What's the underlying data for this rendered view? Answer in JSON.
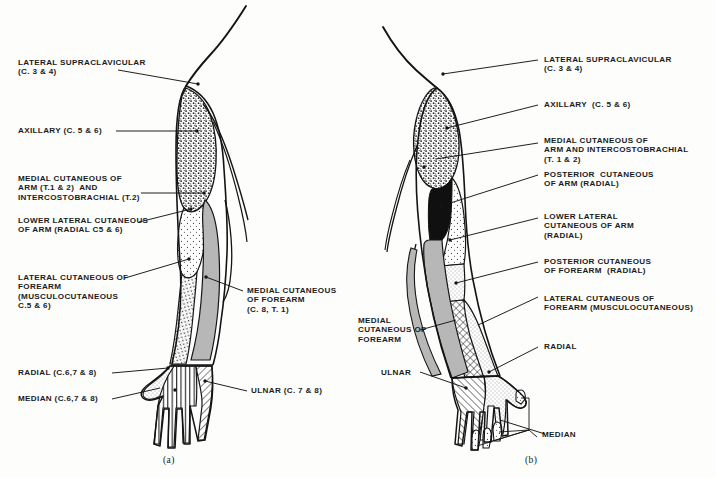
{
  "figure": {
    "panels": [
      {
        "id": "a",
        "caption": "(a)",
        "view": "anterior",
        "labels_left": [
          {
            "name": "lateral-supraclavicular",
            "lines": [
              "LATERAL SUPRACLAVICULAR",
              "(C. 3 & 4)"
            ]
          },
          {
            "name": "axillary",
            "lines": [
              "AXILLARY (C. 5 & 6)"
            ]
          },
          {
            "name": "medial-cutaneous-of-arm-intercostobrachial",
            "lines": [
              "MEDIAL CUTANEOUS OF",
              "ARM (T.1 & 2)  AND",
              "INTERCOSTOBRACHIAL (T.2)"
            ]
          },
          {
            "name": "lower-lateral-cutaneous-of-arm",
            "lines": [
              "LOWER LATERAL CUTANEOUS",
              "OF ARM (RADIAL C5 & 6)"
            ]
          },
          {
            "name": "lateral-cutaneous-of-forearm",
            "lines": [
              "LATERAL CUTANEOUS OF",
              "FOREARM",
              "(MUSCULOCUTANEOUS",
              "C.5 & 6)"
            ]
          },
          {
            "name": "radial",
            "lines": [
              "RADIAL (C.6,7 & 8)"
            ]
          },
          {
            "name": "median",
            "lines": [
              "MEDIAN (C.6,7 & 8)"
            ]
          }
        ],
        "labels_right": [
          {
            "name": "medial-cutaneous-of-forearm",
            "lines": [
              "MEDIAL CUTANEOUS",
              "OF FOREARM",
              "(C. 8, T. 1)"
            ]
          },
          {
            "name": "ulnar",
            "lines": [
              "ULNAR (C. 7 & 8)"
            ]
          }
        ]
      },
      {
        "id": "b",
        "caption": "(b)",
        "view": "posterior",
        "labels_left": [
          {
            "name": "medial-cutaneous-of-forearm",
            "lines": [
              "MEDIAL",
              "CUTANEOUS OF",
              "FOREARM"
            ]
          },
          {
            "name": "ulnar",
            "lines": [
              "ULNAR"
            ]
          }
        ],
        "labels_right": [
          {
            "name": "lateral-supraclavicular",
            "lines": [
              "LATERAL SUPRACLAVICULAR",
              "(C. 3 & 4)"
            ]
          },
          {
            "name": "axillary",
            "lines": [
              "AXILLARY  (C. 5 & 6)"
            ]
          },
          {
            "name": "medial-cutaneous-of-arm-and-intercostobrachial",
            "lines": [
              "MEDIAL CUTANEOUS OF",
              "ARM AND INTERCOSTOBRACHIAL",
              "(T. 1 & 2)"
            ]
          },
          {
            "name": "posterior-cutaneous-of-arm",
            "lines": [
              "POSTERIOR  CUTANEOUS",
              "OF ARM (RADIAL)"
            ]
          },
          {
            "name": "lower-lateral-cutaneous-of-arm",
            "lines": [
              "LOWER LATERAL",
              "CUTANEOUS OF ARM",
              "(RADIAL)"
            ]
          },
          {
            "name": "posterior-cutaneous-of-forearm",
            "lines": [
              "POSTERIOR CUTANEOUS",
              "OF FOREARM  (RADIAL)"
            ]
          },
          {
            "name": "lateral-cutaneous-of-forearm",
            "lines": [
              "LATERAL CUTANEOUS OF",
              "FOREARM (MUSCULOCUTANEOUS)"
            ]
          },
          {
            "name": "radial",
            "lines": [
              "RADIAL"
            ]
          },
          {
            "name": "median",
            "lines": [
              "MEDIAN"
            ]
          }
        ]
      }
    ]
  },
  "colors": {
    "ink": "#1b1b1b",
    "paper": "#fdfdfc",
    "fill_grey": "#b4b4b4",
    "fill_black": "#111111",
    "fill_light": "#ececec"
  }
}
